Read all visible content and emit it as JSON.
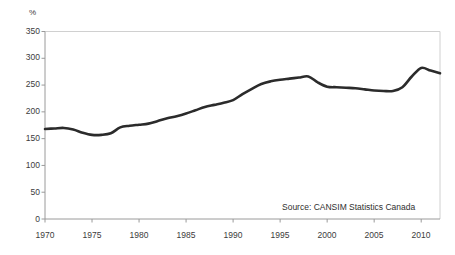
{
  "chart_data": {
    "type": "line",
    "title": "",
    "subtitle": "",
    "xlabel": "",
    "ylabel": "%",
    "ylim": [
      0,
      350
    ],
    "xlim": [
      1970,
      2012
    ],
    "ytick_step": 50,
    "xtick_step": 5,
    "grid": false,
    "legend": null,
    "legend_position": "none",
    "annotations": [
      {
        "name": "source-note",
        "text": "Source: CANSIM Statistics Canada"
      }
    ],
    "ytick_labels": [
      "350",
      "300",
      "250",
      "200",
      "150",
      "100",
      "50",
      "0"
    ],
    "ytick_values": [
      350,
      300,
      250,
      200,
      150,
      100,
      50,
      0
    ],
    "xtick_labels": [
      "1970",
      "1975",
      "1980",
      "1985",
      "1990",
      "1995",
      "2000",
      "2005",
      "2010"
    ],
    "xtick_values": [
      1970,
      1975,
      1980,
      1985,
      1990,
      1995,
      2000,
      2005,
      2010
    ],
    "series": [
      {
        "name": "Household debt to disposable income",
        "color": "#2b2b2b",
        "line_width": 2.6,
        "x": [
          1970,
          1971,
          1972,
          1973,
          1974,
          1975,
          1976,
          1977,
          1978,
          1979,
          1980,
          1981,
          1982,
          1983,
          1984,
          1985,
          1986,
          1987,
          1988,
          1989,
          1990,
          1991,
          1992,
          1993,
          1994,
          1995,
          1996,
          1997,
          1998,
          1999,
          2000,
          2001,
          2002,
          2003,
          2004,
          2005,
          2006,
          2007,
          2008,
          2009,
          2010,
          2011,
          2012
        ],
        "values": [
          168,
          169,
          170,
          167,
          161,
          157,
          157,
          160,
          171,
          174,
          176,
          178,
          183,
          188,
          192,
          197,
          203,
          209,
          213,
          217,
          222,
          233,
          243,
          252,
          257,
          260,
          262,
          264,
          266,
          255,
          247,
          246,
          245,
          244,
          242,
          240,
          239,
          239,
          246,
          266,
          282,
          277,
          272
        ]
      }
    ]
  }
}
